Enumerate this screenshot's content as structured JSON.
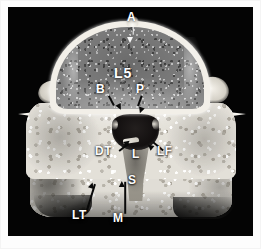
{
  "figure": {
    "kind": "anatomical-specimen-photograph",
    "view": "axial cross-section",
    "caption": "",
    "background_color": "#040404",
    "mat_color": "#fdfdfd",
    "label_color": "#ffffff",
    "leader_color": "#0a0a0a"
  },
  "annotations": [
    {
      "id": "A",
      "label": "A",
      "name": "label-a-anterior-apex",
      "x": 125,
      "y": 11,
      "leader": "down-short-white"
    },
    {
      "id": "L5",
      "label": "L5",
      "name": "label-l5-vertebral-body",
      "x": 114,
      "y": 67,
      "leader": "none"
    },
    {
      "id": "B",
      "label": "B",
      "name": "label-b-basivertebral",
      "x": 95,
      "y": 84,
      "leader": "down-right"
    },
    {
      "id": "P",
      "label": "P",
      "name": "label-p-posterior-margin",
      "x": 133,
      "y": 84,
      "leader": "down-left"
    },
    {
      "id": "DT",
      "label": "DT",
      "name": "label-dt-dural-tube",
      "x": 96,
      "y": 145,
      "leader": "up-right"
    },
    {
      "id": "L",
      "label": "L",
      "name": "label-l-lamina",
      "x": 129,
      "y": 148,
      "leader": "none"
    },
    {
      "id": "LF",
      "label": "LF",
      "name": "label-lf-ligamentum-flavum",
      "x": 155,
      "y": 145,
      "leader": "up-left"
    },
    {
      "id": "S",
      "label": "S",
      "name": "label-s-spinous-process",
      "x": 125,
      "y": 174,
      "leader": "none"
    },
    {
      "id": "LT",
      "label": "LT",
      "name": "label-lt-lateral-tubercle",
      "x": 72,
      "y": 208,
      "leader": "up-right-long"
    },
    {
      "id": "M",
      "label": "M",
      "name": "label-m-mamillary-process",
      "x": 111,
      "y": 211,
      "leader": "up-long"
    }
  ],
  "structures": [
    {
      "name": "vertebral-body-l5",
      "tissue": "cancellous bone",
      "tone": "mid-gray speckled"
    },
    {
      "name": "cortical-rim",
      "tissue": "cortical bone",
      "tone": "bright white"
    },
    {
      "name": "vertebral-canal",
      "tissue": "canal lumen",
      "tone": "black"
    },
    {
      "name": "posterior-arch-mass",
      "tissue": "lamina / pedicle",
      "tone": "light gray"
    },
    {
      "name": "spinous-process-strip",
      "tissue": "bone / ligament",
      "tone": "dark gray"
    },
    {
      "name": "transverse-process-left",
      "tissue": "bone spur",
      "tone": "white"
    },
    {
      "name": "transverse-process-right",
      "tissue": "bone spur",
      "tone": "white"
    },
    {
      "name": "inferior-articular-block",
      "tissue": "bone",
      "tone": "light gray"
    }
  ]
}
